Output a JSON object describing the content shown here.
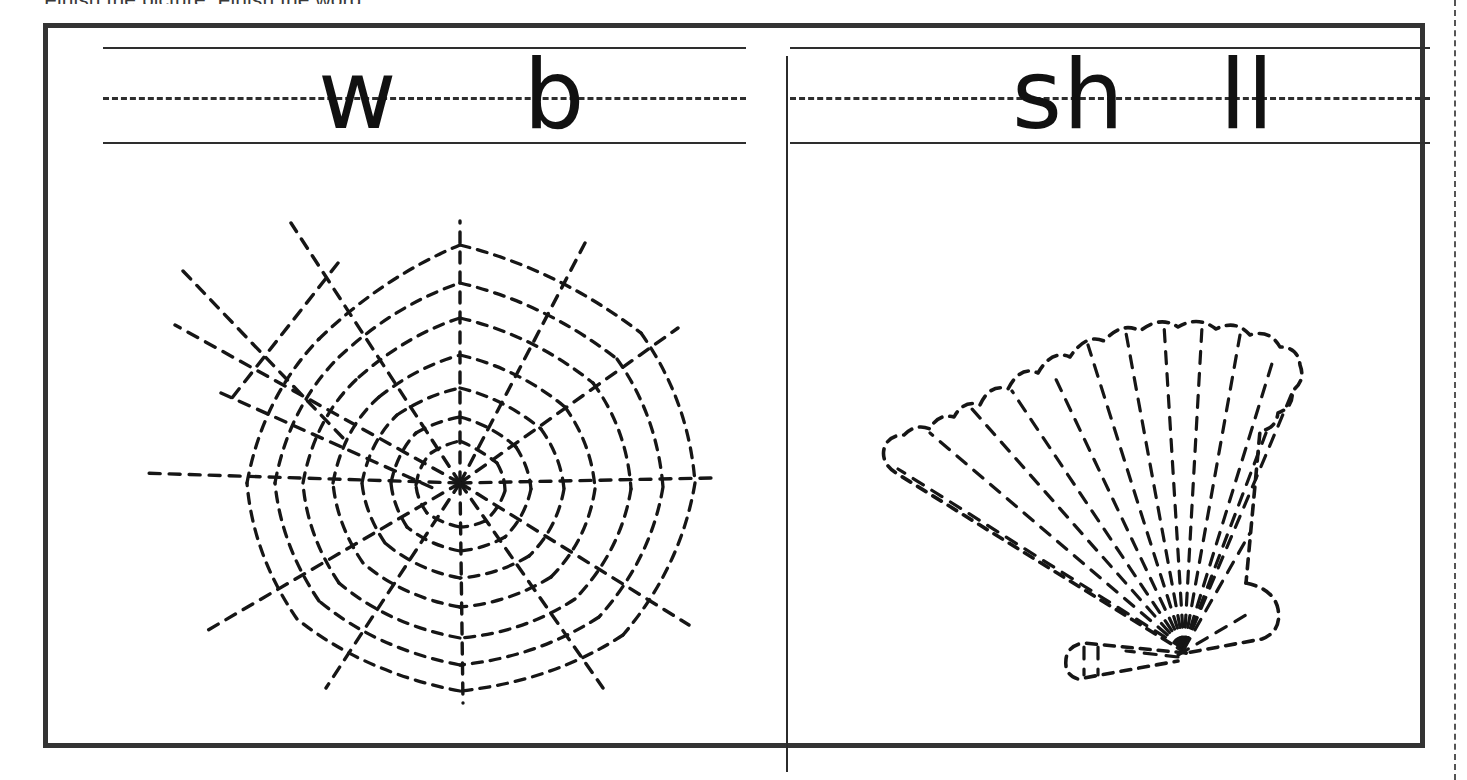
{
  "worksheet": {
    "instruction": "Finish the picture. Finish the word.",
    "cut_guide_label": "cut-line",
    "panels": [
      {
        "id": "panel-left",
        "answer_word": "web",
        "picture": "spider-web",
        "prompt_prefix": "w",
        "prompt_suffix": "b",
        "prompt_display": "w    b"
      },
      {
        "id": "panel-right",
        "answer_word": "shell",
        "picture": "scallop-shell",
        "prompt_prefix": "sh",
        "prompt_suffix": "ll",
        "prompt_display": "sh   ll"
      }
    ],
    "style": {
      "ink": "#161616",
      "rule_color": "#2e2e2e",
      "frame_color": "#333333",
      "paper": "#ffffff"
    }
  }
}
